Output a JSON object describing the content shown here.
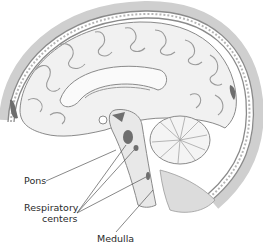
{
  "figure": {
    "labels": {
      "pons": "Pons",
      "respiratory_line1": "Respiratory",
      "respiratory_line2": "centers",
      "medulla": "Medulla"
    }
  },
  "colors": {
    "skull_outline": "#8a8a8a",
    "brain_fill": "#f1f1f1",
    "sulci": "#9a9a9a",
    "dark_regions": "#6e6e6e",
    "leader_lines": "#555555",
    "label_text": "#2a2a2a"
  }
}
